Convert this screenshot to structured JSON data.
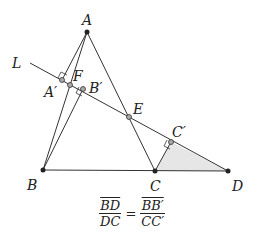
{
  "diagram": {
    "labels": {
      "A": "A",
      "B": "B",
      "C": "C",
      "D": "D",
      "E": "E",
      "F": "F",
      "L": "L",
      "A_prime": "A′",
      "B_prime": "B′",
      "C_prime": "C′"
    },
    "points": {
      "A": [
        87,
        32
      ],
      "B": [
        43,
        170
      ],
      "C": [
        155,
        171
      ],
      "D": [
        228,
        171
      ],
      "E": [
        129,
        117
      ],
      "F": [
        70,
        85
      ],
      "A_prime": [
        62,
        80
      ],
      "B_prime": [
        83,
        89
      ],
      "C_prime": [
        171,
        142
      ],
      "L_start": [
        30,
        63
      ]
    },
    "colors": {
      "line": "#333333",
      "shade": "#e6e6e6",
      "point_fill": "#aaaaaa",
      "vertex_fill": "#222222"
    },
    "formula": {
      "lhs_num": "BD",
      "lhs_den": "DC",
      "equals": "=",
      "rhs_num": "BB′",
      "rhs_den": "CC′"
    }
  }
}
